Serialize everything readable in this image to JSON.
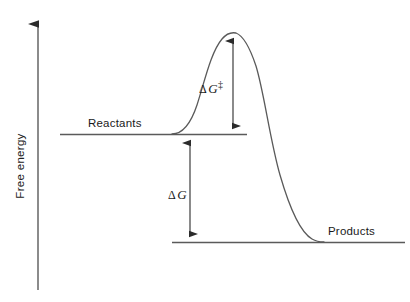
{
  "figure": {
    "title": "",
    "background_color": "#ffffff",
    "stroke_color": "#4a4a4a",
    "text_color": "#1a1a1a"
  },
  "axes": {
    "y_label": "Free energy",
    "y_axis_has_arrow": true,
    "x_axis_visible": false
  },
  "labels": {
    "reactants": "Reactants",
    "products": "Products",
    "activation_energy_delta": "Δ",
    "activation_energy_var": "G",
    "activation_energy_sup": "‡",
    "free_energy_delta": "Δ",
    "free_energy_var": "G"
  },
  "chart_data": {
    "type": "line",
    "xlabel": "",
    "ylabel": "Free energy",
    "grid": false,
    "legend_position": "none",
    "axis_ranges": {
      "x": [
        0,
        410
      ],
      "y_pixels_top_is_high_energy": true
    },
    "levels": [
      {
        "name": "Reactants",
        "label": "Reactants",
        "energy_px_y": 134,
        "x_start_px": 60,
        "x_end_px": 247,
        "label_x_px": 88,
        "label_y_px": 127
      },
      {
        "name": "Products",
        "label": "Products",
        "energy_px_y": 242,
        "x_start_px": 172,
        "x_end_px": 405,
        "label_x_px": 328,
        "label_y_px": 235
      }
    ],
    "reaction_curve": {
      "description": "Smooth sigmoid-barrier-sigmoid energy profile from reactants through transition state to products",
      "start_point_px": [
        172,
        134
      ],
      "peak_point_px": [
        233,
        32
      ],
      "end_point_px": [
        322,
        242
      ],
      "path_d": "M 172 134 C 182 134 190 126 197 105 C 205 80 211 52 222 39 C 227 33 231 32 236 33 C 244 36 250 48 256 66 C 264 92 270 140 280 175 C 289 206 300 232 312 239 C 317 242 320 242 324 242"
    },
    "annotations": [
      {
        "name": "activation-energy-arrow",
        "text": "ΔG‡",
        "meaning": "Gibbs free energy of activation",
        "type": "double-headed-vertical-arrow",
        "x_px": 233,
        "y_top_px": 32,
        "y_bottom_px": 134,
        "magnitude_px": 102,
        "label_x_px": 199,
        "label_y_px": 93
      },
      {
        "name": "free-energy-change-arrow",
        "text": "ΔG",
        "meaning": "Gibbs free energy change of reaction",
        "type": "double-headed-vertical-arrow",
        "x_px": 190,
        "y_top_px": 134,
        "y_bottom_px": 242,
        "magnitude_px": 108,
        "label_x_px": 168,
        "label_y_px": 199
      }
    ],
    "y_axis": {
      "x_px": 38,
      "y_top_px": 20,
      "y_bottom_px": 290,
      "arrowhead": "top"
    }
  }
}
